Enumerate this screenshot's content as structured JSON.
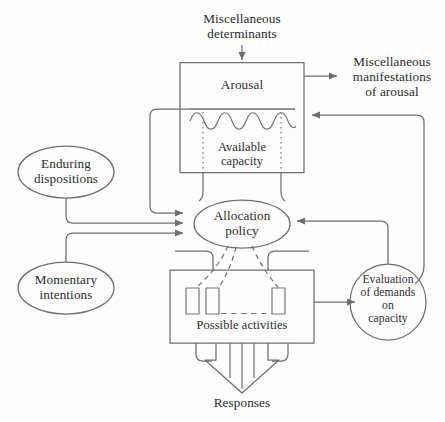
{
  "diagram": {
    "colors": {
      "background": "#fdfdfd",
      "stroke": "#6f6f72",
      "text": "#2b2b2b",
      "activity_box_stroke": "#77777a"
    },
    "nodes": {
      "misc_determinants": {
        "label": "Miscellaneous\ndeterminants",
        "shape": "text"
      },
      "arousal_box": {
        "label": "Arousal",
        "shape": "rectangle"
      },
      "available_capacity": {
        "label": "Available\ncapacity",
        "shape": "rectangle-section"
      },
      "misc_manifestations": {
        "label": "Miscellaneous\nmanifestations\nof arousal",
        "shape": "text"
      },
      "enduring_dispositions": {
        "label": "Enduring\ndispositions",
        "shape": "ellipse"
      },
      "momentary_intentions": {
        "label": "Momentary\nintentions",
        "shape": "ellipse"
      },
      "allocation_policy": {
        "label": "Allocation\npolicy",
        "shape": "ellipse"
      },
      "possible_activities": {
        "label": "Possible activities",
        "shape": "rectangle"
      },
      "evaluation_of_demands": {
        "label": "Evaluation\nof demands\non\ncapacity",
        "shape": "circle"
      },
      "responses": {
        "label": "Responses",
        "shape": "text"
      }
    },
    "edges": [
      {
        "from": "misc_determinants",
        "to": "arousal_box",
        "style": "solid-arrow"
      },
      {
        "from": "arousal_box",
        "to": "misc_manifestations",
        "style": "solid-arrow"
      },
      {
        "from": "available_capacity",
        "to": "allocation_policy",
        "style": "solid-arrow"
      },
      {
        "from": "enduring_dispositions",
        "to": "allocation_policy",
        "style": "solid-arrow"
      },
      {
        "from": "momentary_intentions",
        "to": "allocation_policy",
        "style": "solid-arrow"
      },
      {
        "from": "evaluation_of_demands",
        "to": "allocation_policy",
        "style": "solid-arrow"
      },
      {
        "from": "evaluation_of_demands",
        "to": "arousal_box",
        "style": "solid-arrow"
      },
      {
        "from": "allocation_policy",
        "to": "possible_activities",
        "style": "dashed-curve"
      },
      {
        "from": "possible_activities",
        "to": "evaluation_of_demands",
        "style": "solid-arrow"
      },
      {
        "from": "possible_activities",
        "to": "responses",
        "style": "block-arrow"
      }
    ]
  }
}
